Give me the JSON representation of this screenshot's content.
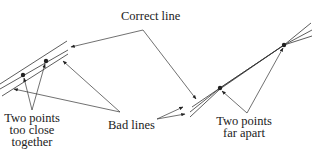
{
  "labels": {
    "correct_line": "Correct line",
    "bad_lines": "Bad lines",
    "close_line1": "Two points",
    "close_line2": "too close",
    "close_line3": "together",
    "far_line1": "Two points",
    "far_line2": "far apart"
  },
  "colors": {
    "ink": "#333333",
    "background": "#ffffff"
  }
}
